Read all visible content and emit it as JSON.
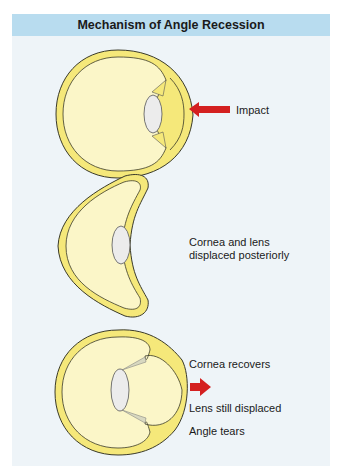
{
  "title": "Mechanism of Angle Recession",
  "colors": {
    "header_bg": "#b8dcef",
    "panel_bg": "#eef4f8",
    "sclera": "#f5e87a",
    "vitreous": "#fbf6c8",
    "lens": "#ececec",
    "arrow": "#d42020"
  },
  "stages": [
    {
      "label_lines": [
        "Impact"
      ],
      "icon": "red-arrow-left-icon"
    },
    {
      "label_lines": [
        "Cornea and lens",
        "displaced posteriorly"
      ]
    },
    {
      "label_lines": [
        "Cornea recovers"
      ],
      "icon": "red-arrow-right-icon",
      "extra_labels": [
        "Lens still displaced",
        "Angle tears"
      ]
    }
  ]
}
